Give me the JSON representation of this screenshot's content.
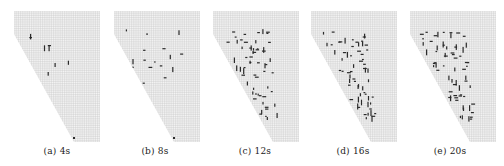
{
  "figure": {
    "panels": [
      {
        "id": "a",
        "label": "(a) 4s",
        "x": 14
      },
      {
        "id": "b",
        "label": "(b) 8s",
        "x": 114
      },
      {
        "id": "c",
        "label": "(c) 12s",
        "x": 213
      },
      {
        "id": "d",
        "label": "(d) 16s",
        "x": 311
      },
      {
        "id": "e",
        "label": "(e) 20s",
        "x": 410
      }
    ],
    "colors": {
      "grid": "#c8c8c8",
      "mesh_fill": "#f4f4f4",
      "crack": "#2a2a2a"
    }
  }
}
